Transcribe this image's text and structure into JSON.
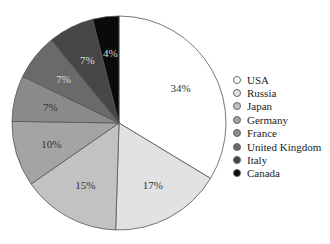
{
  "chart_data": {
    "type": "pie",
    "title": "",
    "categories": [
      "USA",
      "Russia",
      "Japan",
      "Germany",
      "France",
      "United Kingdom",
      "Italy",
      "Canada"
    ],
    "values": [
      34,
      17,
      15,
      10,
      7,
      7,
      7,
      4
    ],
    "labels": [
      "34%",
      "17%",
      "15%",
      "10%",
      "7%",
      "7%",
      "7%",
      "4%"
    ],
    "colors": [
      "#ffffff",
      "#e2e2e2",
      "#c2c2c2",
      "#a4a4a4",
      "#8a8a8a",
      "#6a6a6a",
      "#464646",
      "#0a0a0a"
    ],
    "label_colors": [
      "#333333",
      "#333333",
      "#333333",
      "#333333",
      "#333333",
      "#dddddd",
      "#dddddd",
      "#dddddd"
    ],
    "start_angle_deg": 0,
    "direction": "clockwise",
    "legend_position": "right"
  },
  "legend": {
    "items": [
      {
        "label": "USA"
      },
      {
        "label": "Russia"
      },
      {
        "label": "Japan"
      },
      {
        "label": "Germany"
      },
      {
        "label": "France"
      },
      {
        "label": "United Kingdom"
      },
      {
        "label": "Italy"
      },
      {
        "label": "Canada"
      }
    ]
  }
}
